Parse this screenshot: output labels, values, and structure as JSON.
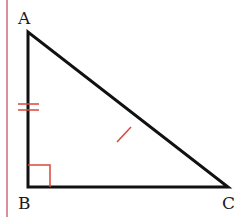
{
  "diagram": {
    "type": "right-triangle",
    "vertices": [
      {
        "name": "A",
        "x": 28,
        "y": 32
      },
      {
        "name": "B",
        "x": 28,
        "y": 187
      },
      {
        "name": "C",
        "x": 228,
        "y": 187
      }
    ],
    "labels": {
      "a": "A",
      "b": "B",
      "c": "C"
    },
    "right_angle_at": "B",
    "marks": {
      "AB": "double tick (congruent)",
      "AC": "single tick (midpoint)"
    },
    "colors": {
      "stroke": "#111111",
      "marks": "#d9473a",
      "margin_line": "#c86a7a"
    }
  }
}
